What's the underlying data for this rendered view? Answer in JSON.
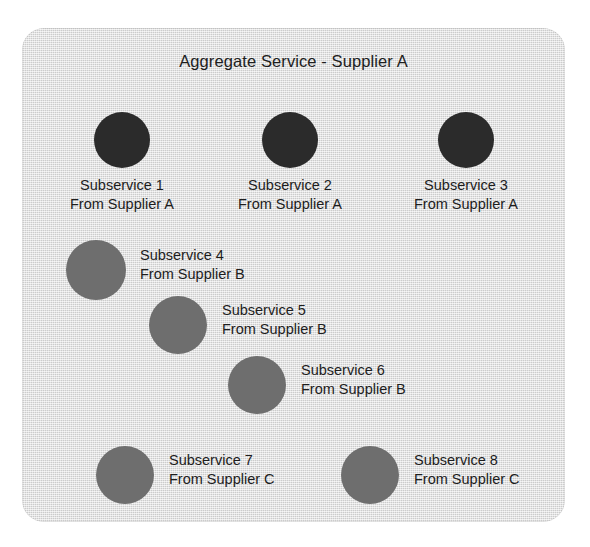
{
  "figure": {
    "title": "Aggregate Service - Supplier A",
    "panel_color": "#d9d9d9",
    "supplier_a_color": "#2b2b2b",
    "supplier_bc_color": "#6e6e6e"
  },
  "nodes": [
    {
      "id": "subservice-1",
      "name": "Subservice 1",
      "supplier": "From Supplier A",
      "group": "A",
      "color": "#2b2b2b",
      "layout": "label-below",
      "dot": {
        "cx": 100,
        "cy": 112,
        "r": 28
      },
      "label": {
        "x": 5,
        "y": 148,
        "w": 190
      }
    },
    {
      "id": "subservice-2",
      "name": "Subservice 2",
      "supplier": "From Supplier A",
      "group": "A",
      "color": "#2b2b2b",
      "layout": "label-below",
      "dot": {
        "cx": 268,
        "cy": 112,
        "r": 28
      },
      "label": {
        "x": 173,
        "y": 148,
        "w": 190
      }
    },
    {
      "id": "subservice-3",
      "name": "Subservice 3",
      "supplier": "From Supplier A",
      "group": "A",
      "color": "#2b2b2b",
      "layout": "label-below",
      "dot": {
        "cx": 444,
        "cy": 112,
        "r": 28
      },
      "label": {
        "x": 349,
        "y": 148,
        "w": 190
      }
    },
    {
      "id": "subservice-4",
      "name": "Subservice 4",
      "supplier": "From Supplier B",
      "group": "B",
      "color": "#6e6e6e",
      "layout": "label-right",
      "dot": {
        "cx": 74,
        "cy": 242,
        "r": 30
      },
      "label": {
        "x": 118,
        "y": 218,
        "w": 200
      }
    },
    {
      "id": "subservice-5",
      "name": "Subservice 5",
      "supplier": "From Supplier B",
      "group": "B",
      "color": "#6e6e6e",
      "layout": "label-right",
      "dot": {
        "cx": 156,
        "cy": 297,
        "r": 29
      },
      "label": {
        "x": 200,
        "y": 273,
        "w": 200
      }
    },
    {
      "id": "subservice-6",
      "name": "Subservice 6",
      "supplier": "From Supplier B",
      "group": "B",
      "color": "#6e6e6e",
      "layout": "label-right",
      "dot": {
        "cx": 235,
        "cy": 357,
        "r": 29
      },
      "label": {
        "x": 279,
        "y": 333,
        "w": 200
      }
    },
    {
      "id": "subservice-7",
      "name": "Subservice 7",
      "supplier": "From Supplier C",
      "group": "C",
      "color": "#6e6e6e",
      "layout": "label-right",
      "dot": {
        "cx": 103,
        "cy": 447,
        "r": 29
      },
      "label": {
        "x": 147,
        "y": 423,
        "w": 200
      }
    },
    {
      "id": "subservice-8",
      "name": "Subservice 8",
      "supplier": "From Supplier C",
      "group": "C",
      "color": "#6e6e6e",
      "layout": "label-right",
      "dot": {
        "cx": 348,
        "cy": 447,
        "r": 29
      },
      "label": {
        "x": 392,
        "y": 423,
        "w": 200
      }
    }
  ]
}
